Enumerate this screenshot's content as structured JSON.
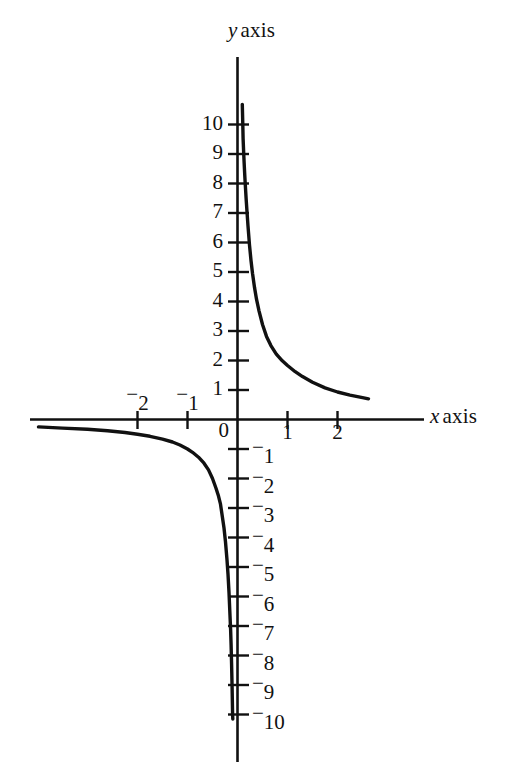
{
  "figure": {
    "background_color": "#ffffff",
    "ink_color": "#111111",
    "x_axis_label": "x axis",
    "x_axis_label_var": "x",
    "x_axis_label_word": "axis",
    "y_axis_label": "y axis",
    "y_axis_label_var": "y",
    "y_axis_label_word": "axis",
    "origin_label": "0"
  },
  "chart_data": {
    "type": "line",
    "title": "",
    "xlabel": "x axis",
    "ylabel": "y axis",
    "xlim": [
      -4.2,
      3.6
    ],
    "ylim": [
      -12.1,
      10.8
    ],
    "grid": false,
    "legend": null,
    "equation": "y = 1/x",
    "x_ticks": [
      -2,
      -1,
      1,
      2
    ],
    "x_tick_labels": [
      "⁻2",
      "⁻1",
      "1",
      "2"
    ],
    "y_ticks": [
      10,
      9,
      8,
      7,
      6,
      5,
      4,
      3,
      2,
      1,
      -1,
      -2,
      -3,
      -4,
      -5,
      -6,
      -7,
      -8,
      -9,
      -10
    ],
    "y_tick_labels": [
      "10",
      "9",
      "8",
      "7",
      "6",
      "5",
      "4",
      "3",
      "2",
      "1",
      "⁻1",
      "⁻2",
      "⁻3",
      "⁻4",
      "⁻5",
      "⁻6",
      "⁻7",
      "⁻8",
      "⁻9",
      "⁻10"
    ],
    "series": [
      {
        "name": "branch-positive",
        "x": [
          0.0935,
          0.1,
          0.11,
          0.12,
          0.13,
          0.14,
          0.15,
          0.17,
          0.19,
          0.21,
          0.24,
          0.27,
          0.3,
          0.34,
          0.38,
          0.43,
          0.5,
          0.58,
          0.67,
          0.78,
          0.9,
          1.0,
          1.15,
          1.3,
          1.5,
          1.75,
          2.0,
          2.25,
          2.5,
          2.62
        ],
        "y": [
          10.7,
          10.0,
          9.09,
          8.33,
          7.69,
          7.14,
          6.67,
          5.88,
          5.26,
          4.76,
          4.17,
          3.7,
          3.33,
          2.94,
          2.63,
          2.33,
          2.0,
          1.72,
          1.49,
          1.28,
          1.11,
          1.0,
          0.87,
          0.77,
          0.67,
          0.57,
          0.5,
          0.44,
          0.4,
          0.38
        ]
      },
      {
        "name": "branch-negative",
        "x": [
          -3.98,
          -3.5,
          -3.0,
          -2.6,
          -2.25,
          -2.0,
          -1.75,
          -1.5,
          -1.3,
          -1.15,
          -1.0,
          -0.9,
          -0.78,
          -0.67,
          -0.58,
          -0.5,
          -0.43,
          -0.38,
          -0.34,
          -0.3,
          -0.27,
          -0.24,
          -0.21,
          -0.19,
          -0.17,
          -0.15,
          -0.14,
          -0.13,
          -0.12,
          -0.11,
          -0.1,
          -0.0985
        ],
        "y": [
          -0.25,
          -0.29,
          -0.33,
          -0.38,
          -0.44,
          -0.5,
          -0.57,
          -0.67,
          -0.77,
          -0.87,
          -1.0,
          -1.11,
          -1.28,
          -1.49,
          -1.72,
          -2.0,
          -2.33,
          -2.63,
          -2.94,
          -3.33,
          -3.7,
          -4.17,
          -4.76,
          -5.26,
          -5.88,
          -6.67,
          -7.14,
          -7.69,
          -8.33,
          -9.09,
          -10.0,
          -10.15
        ]
      }
    ]
  },
  "y_tick_labels_pos": [
    {
      "value": 10,
      "text": "10",
      "neg": false
    },
    {
      "value": 9,
      "text": "9",
      "neg": false
    },
    {
      "value": 8,
      "text": "8",
      "neg": false
    },
    {
      "value": 7,
      "text": "7",
      "neg": false
    },
    {
      "value": 6,
      "text": "6",
      "neg": false
    },
    {
      "value": 5,
      "text": "5",
      "neg": false
    },
    {
      "value": 4,
      "text": "4",
      "neg": false
    },
    {
      "value": 3,
      "text": "3",
      "neg": false
    },
    {
      "value": 2,
      "text": "2",
      "neg": false
    },
    {
      "value": 1,
      "text": "1",
      "neg": false
    }
  ],
  "y_tick_labels_neg": [
    {
      "value": -1,
      "text": "1",
      "neg": true
    },
    {
      "value": -2,
      "text": "2",
      "neg": true
    },
    {
      "value": -3,
      "text": "3",
      "neg": true
    },
    {
      "value": -4,
      "text": "4",
      "neg": true
    },
    {
      "value": -5,
      "text": "5",
      "neg": true
    },
    {
      "value": -6,
      "text": "6",
      "neg": true
    },
    {
      "value": -7,
      "text": "7",
      "neg": true
    },
    {
      "value": -8,
      "text": "8",
      "neg": true
    },
    {
      "value": -9,
      "text": "9",
      "neg": true
    },
    {
      "value": -10,
      "text": "10",
      "neg": true
    }
  ],
  "x_tick_labels_list": [
    {
      "value": -2,
      "text": "2",
      "neg": true
    },
    {
      "value": -1,
      "text": "1",
      "neg": true
    },
    {
      "value": 1,
      "text": "1",
      "neg": false
    },
    {
      "value": 2,
      "text": "2",
      "neg": false
    }
  ]
}
